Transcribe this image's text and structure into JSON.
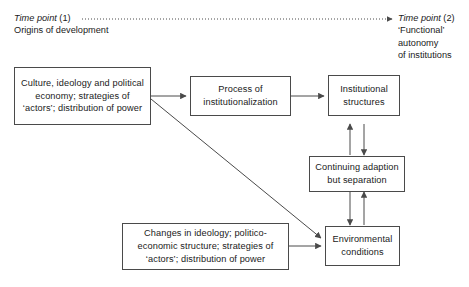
{
  "diagram": {
    "timeline": {
      "start": {
        "label_em": "Time point",
        "label_num": " (1)",
        "sub": "Origins of development"
      },
      "end": {
        "label_em": "Time point",
        "label_num": " (2)",
        "sub_line1": "‘Functional’",
        "sub_line2": "autonomy",
        "sub_line3": "of institutions"
      },
      "connector_style": "dotted-arrow"
    },
    "nodes": [
      {
        "id": "origins-factors",
        "text": "Culture, ideology and political economy; strategies of ‘actors’; distribution of power"
      },
      {
        "id": "process-institutionalization",
        "text": "Process of institutionalization"
      },
      {
        "id": "institutional-structures",
        "text": "Institutional structures"
      },
      {
        "id": "continuing-adaption",
        "text": "Continuing adaption but separation"
      },
      {
        "id": "environmental-conditions",
        "text": "Environmental conditions"
      },
      {
        "id": "changes-factors",
        "text": "Changes in ideology; politico-economic structure; strategies of ‘actors’; distribution of power"
      }
    ],
    "edges": [
      {
        "from": "origins-factors",
        "to": "process-institutionalization",
        "style": "solid-arrow"
      },
      {
        "from": "process-institutionalization",
        "to": "institutional-structures",
        "style": "solid-arrow"
      },
      {
        "from": "origins-factors",
        "to": "environmental-conditions",
        "style": "solid-arrow-diagonal"
      },
      {
        "from": "changes-factors",
        "to": "environmental-conditions",
        "style": "solid-arrow"
      },
      {
        "from": "institutional-structures",
        "to": "continuing-adaption",
        "style": "solid-arrow"
      },
      {
        "from": "continuing-adaption",
        "to": "institutional-structures",
        "style": "solid-arrow"
      },
      {
        "from": "continuing-adaption",
        "to": "environmental-conditions",
        "style": "solid-arrow"
      },
      {
        "from": "environmental-conditions",
        "to": "continuing-adaption",
        "style": "solid-arrow"
      }
    ],
    "colors": {
      "line": "#4a4a4a",
      "text": "#1a1a1a",
      "background": "#ffffff"
    }
  }
}
